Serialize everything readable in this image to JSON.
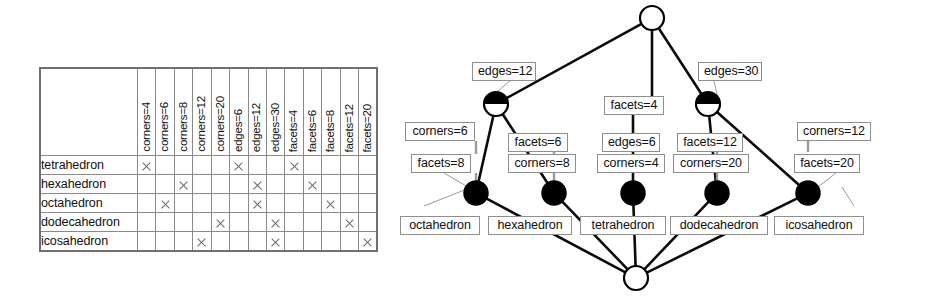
{
  "figure": {
    "kind": "formal-concept-analysis",
    "caption": ""
  },
  "context_table": {
    "corner_label": "",
    "objects": [
      "tetrahedron",
      "hexahedron",
      "octahedron",
      "dodecahedron",
      "icosahedron"
    ],
    "attributes": [
      "corners=4",
      "corners=6",
      "corners=8",
      "corners=12",
      "corners=20",
      "edges=6",
      "edges=12",
      "edges=30",
      "facets=4",
      "facets=6",
      "facets=8",
      "facets=12",
      "facets=20"
    ],
    "mark_glyph": "cross",
    "incidence": [
      [
        1,
        0,
        0,
        0,
        0,
        1,
        0,
        0,
        1,
        0,
        0,
        0,
        0
      ],
      [
        0,
        0,
        1,
        0,
        0,
        0,
        1,
        0,
        0,
        1,
        0,
        0,
        0
      ],
      [
        0,
        1,
        0,
        0,
        0,
        0,
        1,
        0,
        0,
        0,
        1,
        0,
        0
      ],
      [
        0,
        0,
        0,
        0,
        1,
        0,
        0,
        1,
        0,
        0,
        0,
        1,
        0
      ],
      [
        0,
        0,
        0,
        1,
        0,
        0,
        0,
        1,
        0,
        0,
        0,
        0,
        1
      ]
    ]
  },
  "lattice": {
    "nodes": [
      {
        "id": "top",
        "style": "empty",
        "cx": 268,
        "cy": 18
      },
      {
        "id": "m12",
        "style": "half-upper",
        "cx": 112,
        "cy": 104
      },
      {
        "id": "m30",
        "style": "half-upper",
        "cx": 324,
        "cy": 104
      },
      {
        "id": "octa",
        "style": "filled",
        "cx": 92,
        "cy": 193
      },
      {
        "id": "hexa",
        "style": "filled",
        "cx": 170,
        "cy": 193
      },
      {
        "id": "tetra",
        "style": "filled",
        "cx": 249,
        "cy": 193
      },
      {
        "id": "dodeca",
        "style": "filled",
        "cx": 333,
        "cy": 193
      },
      {
        "id": "icosa",
        "style": "filled",
        "cx": 424,
        "cy": 193
      },
      {
        "id": "bottom",
        "style": "empty",
        "cx": 252,
        "cy": 278
      }
    ],
    "edges": [
      [
        "top",
        "m12"
      ],
      [
        "top",
        "tetra_chain"
      ],
      [
        "top",
        "m30"
      ],
      [
        "m12",
        "octa"
      ],
      [
        "m12",
        "hexa"
      ],
      [
        "m30",
        "dodeca"
      ],
      [
        "m30",
        "icosa"
      ],
      [
        "octa",
        "bottom"
      ],
      [
        "hexa",
        "bottom"
      ],
      [
        "tetra",
        "bottom"
      ],
      [
        "dodeca",
        "bottom"
      ],
      [
        "icosa",
        "bottom"
      ]
    ],
    "attribute_labels": [
      {
        "id": "lbl-edges-12",
        "text": "edges=12",
        "x": 88,
        "y": 62,
        "w": 64,
        "node": "m12",
        "leader": "diagonal"
      },
      {
        "id": "lbl-edges-30",
        "text": "edges=30",
        "x": 314,
        "y": 62,
        "w": 64,
        "node": "m30",
        "leader": "diagonal"
      },
      {
        "id": "lbl-facets-4",
        "text": "facets=4",
        "x": 220,
        "y": 96,
        "w": 60,
        "node": "tetra",
        "leader": "vertical"
      },
      {
        "id": "lbl-corners-6",
        "text": "corners=6",
        "x": 21,
        "y": 122,
        "w": 70,
        "node": "octa",
        "leader": "vertical"
      },
      {
        "id": "lbl-facets-6",
        "text": "facets=6",
        "x": 124,
        "y": 133,
        "w": 60,
        "node": "hexa",
        "leader": "vertical"
      },
      {
        "id": "lbl-edges-6",
        "text": "edges=6",
        "x": 218,
        "y": 133,
        "w": 58,
        "node": "tetra",
        "leader": "vertical"
      },
      {
        "id": "lbl-facets-12",
        "text": "facets=12",
        "x": 293,
        "y": 133,
        "w": 66,
        "node": "dodeca",
        "leader": "vertical"
      },
      {
        "id": "lbl-corners-12",
        "text": "corners=12",
        "x": 413,
        "y": 122,
        "w": 74,
        "node": "icosa",
        "leader": "vertical"
      },
      {
        "id": "lbl-facets-8",
        "text": "facets=8",
        "x": 27,
        "y": 154,
        "w": 60,
        "node": "octa",
        "leader": "diagonal"
      },
      {
        "id": "lbl-corners-8",
        "text": "corners=8",
        "x": 124,
        "y": 154,
        "w": 68,
        "node": "hexa",
        "leader": "vertical"
      },
      {
        "id": "lbl-corners-4",
        "text": "corners=4",
        "x": 213,
        "y": 154,
        "w": 68,
        "node": "tetra",
        "leader": "vertical"
      },
      {
        "id": "lbl-corners-20",
        "text": "corners=20",
        "x": 289,
        "y": 154,
        "w": 76,
        "node": "dodeca",
        "leader": "vertical"
      },
      {
        "id": "lbl-facets-20",
        "text": "facets=20",
        "x": 410,
        "y": 154,
        "w": 66,
        "node": "icosa",
        "leader": "diagonal"
      }
    ],
    "object_labels": [
      {
        "id": "obj-octahedron",
        "text": "octahedron",
        "x": 16,
        "y": 216,
        "w": 80,
        "node": "octa"
      },
      {
        "id": "obj-hexahedron",
        "text": "hexahedron",
        "x": 104,
        "y": 216,
        "w": 84,
        "node": "hexa"
      },
      {
        "id": "obj-tetrahedron",
        "text": "tetrahedron",
        "x": 196,
        "y": 216,
        "w": 86,
        "node": "tetra"
      },
      {
        "id": "obj-dodecahedron",
        "text": "dodecahedron",
        "x": 286,
        "y": 216,
        "w": 98,
        "node": "dodeca"
      },
      {
        "id": "obj-icosahedron",
        "text": "icosahedron",
        "x": 390,
        "y": 216,
        "w": 90,
        "node": "icosa"
      }
    ]
  },
  "colors": {
    "ink": "#101010",
    "node_fill": "#000000",
    "node_empty": "#ffffff",
    "rule": "#8f8f8f",
    "cross": "#6a6a6a",
    "background": "#ffffff"
  }
}
